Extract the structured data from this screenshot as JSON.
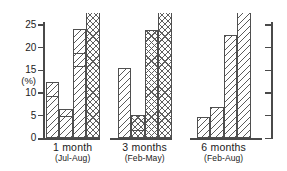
{
  "chart_data": {
    "type": "bar",
    "title": "",
    "xlabel": "",
    "ylabel": "(%)",
    "ylim": [
      0,
      28
    ],
    "yticks": [
      0,
      5,
      10,
      15,
      20,
      25
    ],
    "grid": false,
    "legend": "none",
    "note": "Grouped stacked bar chart; the fourth bar of each group is clipped by the top edge of the figure.",
    "categories": [
      "1 month",
      "3 months",
      "6 months"
    ],
    "category_subtitles": [
      "(Jul-Aug)",
      "(Feb-May)",
      "(Feb-Aug)"
    ],
    "groups": [
      {
        "label": "1 month",
        "sublabel": "(Jul-Aug)",
        "bars": [
          {
            "value": 12.4,
            "pattern": "diagonal",
            "segments": [
              9.5,
              12.4
            ],
            "clipped": false
          },
          {
            "value": 6.5,
            "pattern": "diagonal",
            "segments": [
              5.0,
              6.5
            ],
            "clipped": false
          },
          {
            "value": 24.0,
            "pattern": "diagonal",
            "segments": [
              16.0,
              19.0,
              24.0
            ],
            "clipped": false
          },
          {
            "value": 28.0,
            "pattern": "cross",
            "segments": [
              28.0
            ],
            "clipped": true
          }
        ]
      },
      {
        "label": "3 months",
        "sublabel": "(Feb-May)",
        "bars": [
          {
            "value": 15.6,
            "pattern": "diagonal",
            "segments": [
              15.6
            ],
            "clipped": false
          },
          {
            "value": 5.1,
            "pattern": "cross",
            "segments": [
              2.0,
              5.1
            ],
            "clipped": false
          },
          {
            "value": 23.8,
            "pattern": "cross",
            "segments": [
              23.8
            ],
            "clipped": false
          },
          {
            "value": 28.0,
            "pattern": "cross",
            "segments": [
              28.0
            ],
            "clipped": true
          }
        ]
      },
      {
        "label": "6 months",
        "sublabel": "(Feb-Aug)",
        "bars": [
          {
            "value": 4.7,
            "pattern": "diagonal",
            "segments": [
              4.7
            ],
            "clipped": false
          },
          {
            "value": 6.9,
            "pattern": "diagonal",
            "segments": [
              6.9
            ],
            "clipped": false
          },
          {
            "value": 22.8,
            "pattern": "diagonal",
            "segments": [
              22.8
            ],
            "clipped": false
          },
          {
            "value": 28.0,
            "pattern": "diagonal",
            "segments": [
              28.0
            ],
            "clipped": true
          }
        ]
      }
    ]
  },
  "axis": {
    "unit_label": "(%)",
    "tick_labels": [
      "25",
      "20",
      "15",
      "10",
      "5",
      "0"
    ]
  }
}
